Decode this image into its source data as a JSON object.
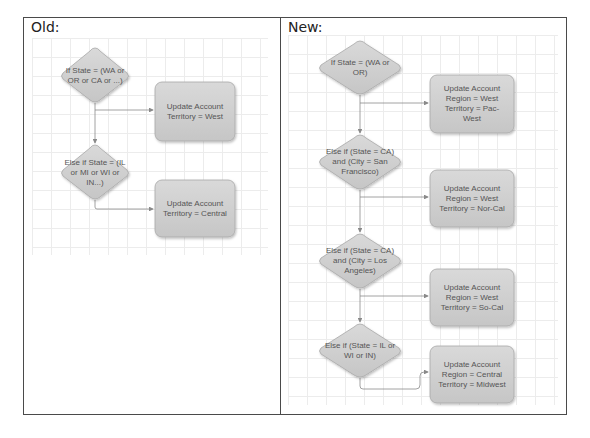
{
  "panels": {
    "old": {
      "title": "Old:",
      "decisions": [
        {
          "text": "If State = (WA or OR or CA or ...)"
        },
        {
          "text": "Else if State = (IL or MI or WI or IN...)"
        }
      ],
      "actions": [
        {
          "text": "Update Account Territory = West"
        },
        {
          "text": "Update Account Territory = Central"
        }
      ]
    },
    "new": {
      "title": "New:",
      "decisions": [
        {
          "text": "If State = (WA or OR)"
        },
        {
          "text": "Else if (State = CA) and (City = San Francisco)"
        },
        {
          "text": "Else if (State = CA) and (City = Los Angeles)"
        },
        {
          "text": "Else if (State = IL or WI or IN)"
        }
      ],
      "actions": [
        {
          "text": "Update Account Region = West Territory = Pac-West"
        },
        {
          "text": "Update Account Region = West Territory = Nor-Cal"
        },
        {
          "text": "Update Account Region = West Territory = So-Cal"
        },
        {
          "text": "Update Account Region = Central Territory = Midwest"
        }
      ]
    }
  },
  "colors": {
    "node_fill": "#cfcfcf",
    "node_stroke": "#a8a8a8",
    "connector": "#8a8a8a",
    "grid": "#ececec",
    "frame": "#4a4a4a"
  }
}
